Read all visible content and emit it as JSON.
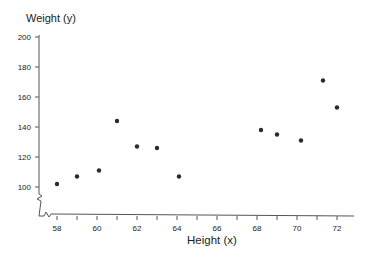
{
  "chart_data": {
    "type": "scatter",
    "title": "",
    "xlabel": "Height (x)",
    "ylabel": "Weight (y)",
    "xlim": [
      57.5,
      72.8
    ],
    "ylim": [
      80,
      200
    ],
    "xticks": [
      58,
      59,
      60,
      61,
      62,
      63,
      64,
      65,
      66,
      67,
      68,
      69,
      70,
      71,
      72
    ],
    "xtick_labels": [
      "58",
      "60",
      "62",
      "64",
      "66",
      "68",
      "70",
      "72"
    ],
    "yticks": [
      100,
      120,
      140,
      160,
      180,
      200
    ],
    "ytick_labels": [
      "100",
      "120",
      "140",
      "160",
      "180",
      "200"
    ],
    "grid": false,
    "axis_breaks": true,
    "marker_color": "#2b2b2b",
    "points": [
      {
        "x": 58,
        "y": 102
      },
      {
        "x": 59,
        "y": 107
      },
      {
        "x": 60.1,
        "y": 111
      },
      {
        "x": 61,
        "y": 144
      },
      {
        "x": 62,
        "y": 127
      },
      {
        "x": 63,
        "y": 126
      },
      {
        "x": 64.1,
        "y": 107
      },
      {
        "x": 68.2,
        "y": 138
      },
      {
        "x": 69,
        "y": 135
      },
      {
        "x": 70.2,
        "y": 131
      },
      {
        "x": 71.3,
        "y": 171
      },
      {
        "x": 72,
        "y": 153
      }
    ]
  }
}
